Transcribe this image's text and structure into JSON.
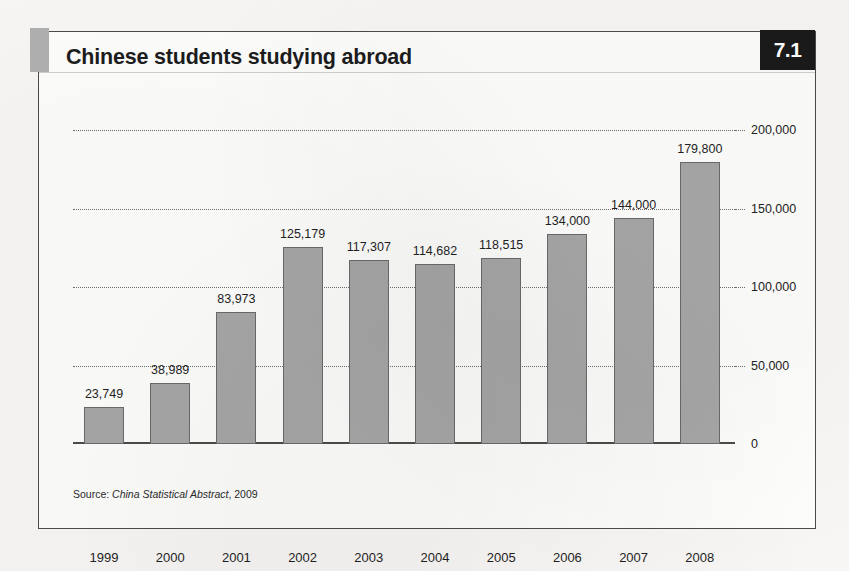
{
  "figure": {
    "title": "Chinese students studying abroad",
    "badge": "7.1",
    "source_prefix": "Source:",
    "source_title": "China Statistical Abstract",
    "source_suffix": ", 2009",
    "accent_color": "#b0b0b0",
    "badge_bg": "#1a1a1a",
    "badge_text_color": "#ffffff",
    "bar_fill": "#a6a6a6",
    "bar_stroke": "#6a6a6a",
    "frame_border": "#4a4a4a",
    "page_bg": "#f7f6f4"
  },
  "chart_data": {
    "type": "bar",
    "title": "Chinese students studying abroad",
    "xlabel": "",
    "ylabel": "",
    "categories": [
      "1999",
      "2000",
      "2001",
      "2002",
      "2003",
      "2004",
      "2005",
      "2006",
      "2007",
      "2008"
    ],
    "values": [
      23749,
      38989,
      83973,
      125179,
      117307,
      114682,
      118515,
      134000,
      144000,
      179800
    ],
    "value_labels": [
      "23,749",
      "38,989",
      "83,973",
      "125,179",
      "117,307",
      "114,682",
      "118,515",
      "134,000",
      "144,000",
      "179,800"
    ],
    "ylim": [
      0,
      200000
    ],
    "yticks": [
      0,
      50000,
      100000,
      150000,
      200000
    ],
    "ytick_labels": [
      "0",
      "50,000",
      "100,000",
      "150,000",
      "200,000"
    ],
    "grid": true,
    "grid_style": "dotted",
    "legend": "none",
    "data_labels": true
  }
}
